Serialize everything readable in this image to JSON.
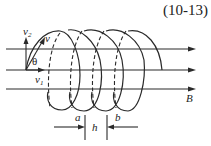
{
  "equation_number": "(10-13)",
  "labels": {
    "v": "v",
    "v2_base": "v",
    "v2_sub": "2",
    "v1_base": "v",
    "v1_sub": "1",
    "theta": "θ",
    "field": "B",
    "a": "a",
    "h": "h",
    "b": "b"
  },
  "diagram": {
    "field_lines": 3,
    "helix_turns": 4,
    "color": "#2a2a2a"
  }
}
